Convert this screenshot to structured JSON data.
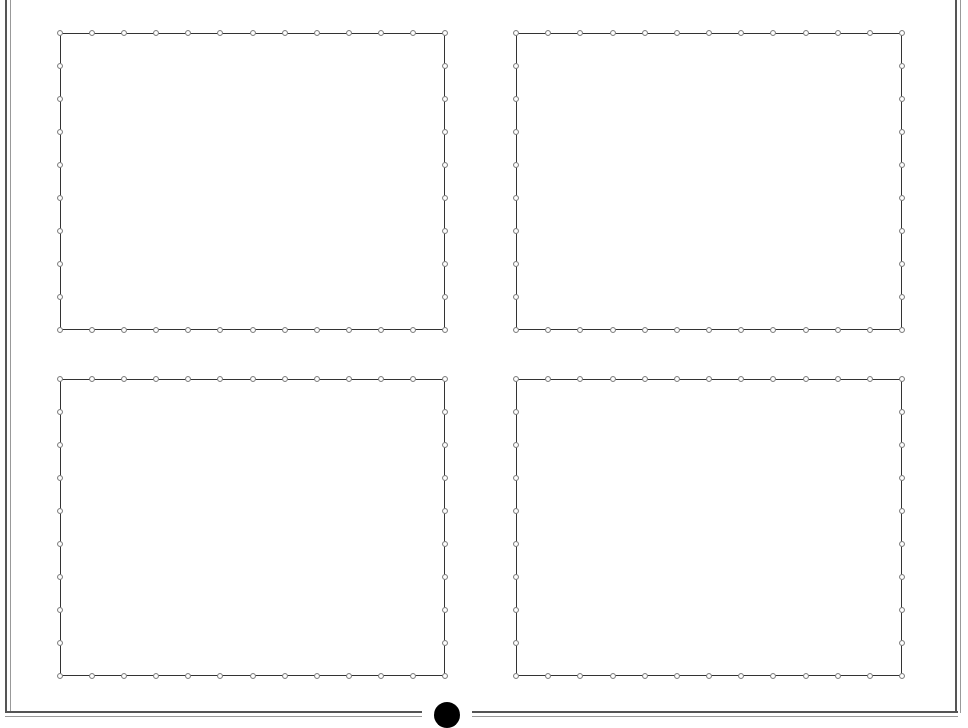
{
  "diagram": {
    "title": "",
    "panels": [
      {
        "id": "top-left",
        "x": 60,
        "y": 33,
        "w": 385,
        "h": 297
      },
      {
        "id": "top-right",
        "x": 516,
        "y": 33,
        "w": 386,
        "h": 297
      },
      {
        "id": "bottom-left",
        "x": 60,
        "y": 379,
        "w": 385,
        "h": 297
      },
      {
        "id": "bottom-right",
        "x": 516,
        "y": 379,
        "w": 386,
        "h": 297
      }
    ],
    "markers_per_horizontal_edge": 12,
    "markers_per_vertical_edge": 9,
    "center_dot": {
      "x": 447,
      "y": 715,
      "color": "#000000"
    },
    "colors": {
      "line": "#333333",
      "marker": "#777777",
      "frame": "#555555"
    }
  }
}
